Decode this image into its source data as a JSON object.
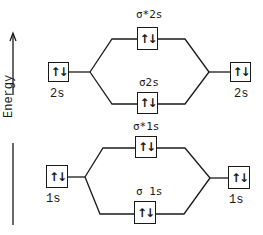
{
  "axis": {
    "label": "Energy",
    "direction": "up"
  },
  "colors": {
    "line": "#1a1a1a",
    "background": "#ffffff"
  },
  "levels": {
    "left_2s": {
      "label": "2s",
      "electrons": "↑↓"
    },
    "right_2s": {
      "label": "2s",
      "electrons": "↑↓"
    },
    "sigma_star_2s": {
      "label": "σ*2s",
      "electrons": "↑↓"
    },
    "sigma_2s": {
      "label": "σ2s",
      "electrons": "↑↓"
    },
    "left_1s": {
      "label": "1s",
      "electrons": "↑↓"
    },
    "right_1s": {
      "label": "1s",
      "electrons": "↑↓"
    },
    "sigma_star_1s": {
      "label": "σ*1s",
      "electrons": "↑↓"
    },
    "sigma_1s": {
      "label": "σ 1s",
      "electrons": "↑↓"
    }
  }
}
